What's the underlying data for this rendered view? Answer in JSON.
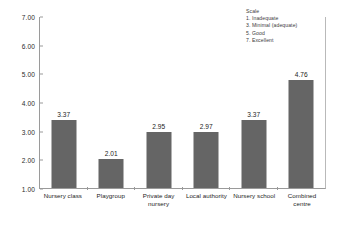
{
  "legend": {
    "title": "Scale",
    "items": [
      "1. Inadequate",
      "3. Minimal (adequate)",
      "5. Good",
      "7. Excellent"
    ]
  },
  "axis": {
    "yticks": [
      "7.00",
      "6.00",
      "5.00",
      "4.00",
      "3.00",
      "2.00",
      "1.00"
    ]
  },
  "colors": {
    "bar_fill": "#656565",
    "axis_line": "#9a9a9a",
    "text": "#1c1c1c",
    "background": "#ffffff"
  },
  "chart_data": {
    "type": "bar",
    "title": "",
    "xlabel": "",
    "ylabel": "",
    "ylim": [
      1.0,
      7.0
    ],
    "ytick_values": [
      1.0,
      2.0,
      3.0,
      4.0,
      5.0,
      6.0,
      7.0
    ],
    "grid": false,
    "legend_position": "top-right",
    "categories": [
      "Nursery class",
      "Playgroup",
      "Private day nursery",
      "Local authority",
      "Nursery school",
      "Combined centre"
    ],
    "category_lines": [
      [
        "Nursery class"
      ],
      [
        "Playgroup"
      ],
      [
        "Private day",
        "nursery"
      ],
      [
        "Local authority"
      ],
      [
        "Nursery school"
      ],
      [
        "Combined",
        "centre"
      ]
    ],
    "values": [
      3.37,
      2.01,
      2.95,
      2.97,
      3.37,
      4.76
    ],
    "value_labels": [
      "3.37",
      "2.01",
      "2.95",
      "2.97",
      "3.37",
      "4.76"
    ],
    "annotations": [
      "Scale",
      "1. Inadequate",
      "3. Minimal (adequate)",
      "5. Good",
      "7. Excellent"
    ]
  }
}
